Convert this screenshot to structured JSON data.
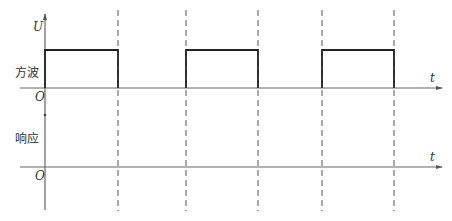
{
  "diagram": {
    "type": "timing-diagram",
    "top_panel": {
      "label": "方波",
      "y_axis_label": "U",
      "origin_label": "O",
      "x_axis_label": "t",
      "pulses": [
        {
          "start_x": 45,
          "end_x": 118
        },
        {
          "start_x": 186,
          "end_x": 258
        },
        {
          "start_x": 322,
          "end_x": 394
        }
      ]
    },
    "bottom_panel": {
      "label": "响应",
      "origin_label": "O",
      "x_axis_label": "t"
    },
    "dashed_markers_x": [
      118,
      186,
      258,
      322,
      394
    ],
    "colors": {
      "axis": "#555555",
      "pulse": "#222222",
      "dashed": "#555555"
    }
  }
}
